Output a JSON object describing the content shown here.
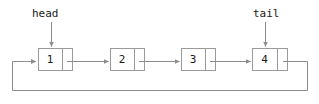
{
  "diagram": {
    "type": "circular-singly-linked-list",
    "stroke_color": "#999999",
    "text_color": "#1a1a1a",
    "background_color": "#ffffff",
    "pointers": [
      {
        "name": "head-pointer",
        "label": "head",
        "target_node": "1"
      },
      {
        "name": "tail-pointer",
        "label": "tail",
        "target_node": "4"
      }
    ],
    "nodes": [
      {
        "value": "1"
      },
      {
        "value": "2"
      },
      {
        "value": "3"
      },
      {
        "value": "4"
      }
    ],
    "links": [
      {
        "from": "1",
        "to": "2"
      },
      {
        "from": "2",
        "to": "3"
      },
      {
        "from": "3",
        "to": "4"
      },
      {
        "from": "4",
        "to": "1"
      }
    ]
  }
}
